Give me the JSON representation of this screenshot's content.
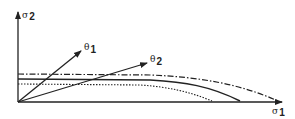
{
  "axes": {
    "y_label": {
      "symbol": "σ",
      "subscript": "2"
    },
    "x_label": {
      "symbol": "σ",
      "subscript": "1"
    }
  },
  "vectors": [
    {
      "name": "theta-1",
      "symbol": "θ",
      "subscript": "1"
    },
    {
      "name": "theta-2",
      "symbol": "θ",
      "subscript": "2"
    }
  ],
  "curves": [
    {
      "name": "dash-dot-curve",
      "style": "dash-dot"
    },
    {
      "name": "solid-curve",
      "style": "solid"
    },
    {
      "name": "dotted-curve",
      "style": "dotted"
    }
  ],
  "colors": {
    "ink": "#222222",
    "background": "#ffffff"
  }
}
